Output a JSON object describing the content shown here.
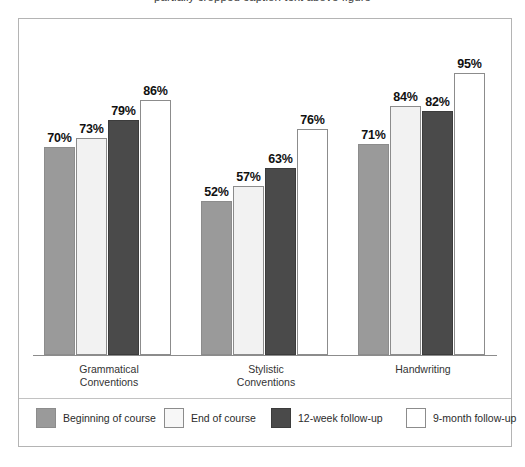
{
  "top_cropped_caption": "partially cropped caption text above figure",
  "chart_data": {
    "type": "bar",
    "title": "",
    "xlabel": "",
    "ylabel": "",
    "ylim": [
      0,
      100
    ],
    "grid": false,
    "legend_position": "bottom",
    "value_suffix": "%",
    "categories": [
      "Grammatical\nConventions",
      "Stylistic\nConventions",
      "Handwriting"
    ],
    "category_lines": [
      [
        "Grammatical",
        "Conventions"
      ],
      [
        "Stylistic",
        "Conventions"
      ],
      [
        "Handwriting"
      ]
    ],
    "series": [
      {
        "name": "Beginning of course",
        "color": "#9a9a9a",
        "values": [
          70,
          52,
          71
        ],
        "labels": [
          "70%",
          "52%",
          "71%"
        ]
      },
      {
        "name": "End of course",
        "color": "#f2f2f2",
        "values": [
          73,
          57,
          84
        ],
        "labels": [
          "73%",
          "57%",
          "84%"
        ]
      },
      {
        "name": "12-week follow-up",
        "color": "#4a4a4a",
        "values": [
          79,
          63,
          82
        ],
        "labels": [
          "79%",
          "63%",
          "82%"
        ]
      },
      {
        "name": "9-month follow-up",
        "color": "#ffffff",
        "values": [
          86,
          76,
          95
        ],
        "labels": [
          "86%",
          "76%",
          "95%"
        ]
      }
    ]
  },
  "legend": {
    "items": [
      {
        "label": "Beginning of course"
      },
      {
        "label": "End of course"
      },
      {
        "label": "12-week follow-up"
      },
      {
        "label": "9-month follow-up"
      }
    ]
  },
  "colors": {
    "frame_border": "#b4b4b4",
    "axis_line": "#8c8c8c",
    "bar_outline": "#8c8c8c",
    "text": "#1a1a1a",
    "background": "#ffffff"
  }
}
